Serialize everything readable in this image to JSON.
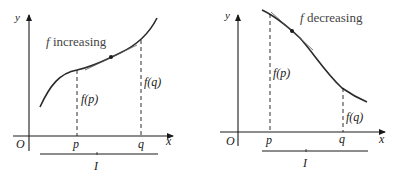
{
  "left_panel": {
    "caption_f": "f",
    "caption_word": " increasing",
    "axis_y": "y",
    "axis_x": "x",
    "origin": "O",
    "tick_p": "p",
    "tick_q": "q",
    "fp_label": "f(p)",
    "fq_label": "f(q)",
    "interval": "I"
  },
  "right_panel": {
    "caption_f": "f",
    "caption_word": " decreasing",
    "axis_y": "y",
    "axis_x": "x",
    "origin": "O",
    "tick_p": "p",
    "tick_q": "q",
    "fp_label": "f(p)",
    "fq_label": "f(q)",
    "interval": "I"
  },
  "colors": {
    "ink": "#1a1a1a",
    "curve": "#2a2a2a",
    "caption": "#444444"
  }
}
